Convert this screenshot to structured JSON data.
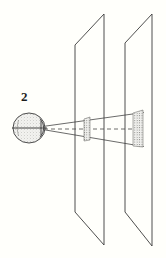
{
  "figure": {
    "label": "2",
    "caption_text": "",
    "background_color": "#fffffb",
    "ink_color": "#3a3a3a",
    "label_color": "#1d1d1d"
  },
  "diagram": {
    "eye": {
      "name": "eye",
      "center_x": 29,
      "center_y": 128,
      "radius_x": 16,
      "radius_y": 15,
      "fill": "#e9e9e6",
      "stroke": "#3a3a3a",
      "optic_axis_label": "optical axis",
      "lens_x": 42,
      "lens_y": 128
    },
    "planes": [
      {
        "name": "near-plane",
        "top_left_x": 75,
        "top_left_y": 45,
        "top_right_x": 104,
        "top_right_y": 14,
        "bottom_right_x": 104,
        "bottom_right_y": 245,
        "bottom_left_x": 75,
        "bottom_left_y": 212,
        "stroke": "#3a3a3a"
      },
      {
        "name": "far-plane",
        "top_left_x": 125,
        "top_left_y": 43,
        "top_right_x": 152,
        "top_right_y": 14,
        "bottom_right_x": 152,
        "bottom_right_y": 246,
        "bottom_left_x": 125,
        "bottom_left_y": 212,
        "stroke": "#3a3a3a"
      }
    ],
    "patches": [
      {
        "name": "near-plane-patch",
        "center_x": 87,
        "center_y": 129,
        "width": 7,
        "height": 22,
        "description": "small stippled texture patch on near plane"
      },
      {
        "name": "far-plane-patch",
        "center_x": 138,
        "center_y": 129,
        "width": 11,
        "height": 35,
        "description": "larger stippled texture patch on far plane"
      }
    ],
    "rays": {
      "name": "projection-rays",
      "origin_x": 42,
      "origin_y": 128,
      "upper_end_x": 143,
      "upper_end_y": 113,
      "lower_end_x": 143,
      "lower_end_y": 146,
      "stroke": "#3a3a3a"
    },
    "axis_line": {
      "name": "optical-axis-dashed",
      "start_x": 44,
      "start_y": 129,
      "end_x": 140,
      "end_y": 129,
      "dash_pattern": "4 3"
    }
  }
}
